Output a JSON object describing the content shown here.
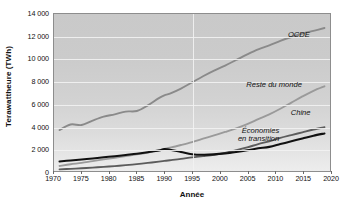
{
  "chart_data": {
    "type": "line",
    "title": "",
    "subtitle": "",
    "xlabel": "Année",
    "ylabel": "Terawattheure (TWh)",
    "xlim": [
      1970,
      2020
    ],
    "ylim": [
      0,
      14000
    ],
    "x_ticks": [
      1970,
      1975,
      1980,
      1985,
      1990,
      1995,
      2000,
      2005,
      2010,
      2015,
      2020
    ],
    "x_tick_labels": [
      "1970",
      "1975",
      "1980",
      "1985",
      "1990",
      "1995",
      "2000",
      "2005",
      "2010",
      "2015",
      "2020"
    ],
    "y_ticks": [
      0,
      2000,
      4000,
      6000,
      8000,
      10000,
      12000,
      14000
    ],
    "y_tick_labels": [
      "0",
      "2 000",
      "4 000",
      "6 000",
      "8 000",
      "10 000",
      "12 000",
      "14 000"
    ],
    "grid": "both-white-gridlines",
    "legend_position": "inline-end-of-line-annotations",
    "x": [
      1971,
      1973,
      1975,
      1977,
      1979,
      1981,
      1983,
      1985,
      1987,
      1989,
      1990,
      1991,
      1993,
      1995,
      1997,
      1999,
      2001,
      2003,
      2005,
      2007,
      2009,
      2011,
      2013,
      2015,
      2017,
      2019
    ],
    "series": [
      {
        "name": "OCDE",
        "label": "OCDE",
        "color": "#8a8a8a",
        "width": 1.9,
        "values": [
          3650,
          4150,
          4100,
          4500,
          4850,
          5050,
          5300,
          5350,
          5850,
          6500,
          6750,
          6900,
          7350,
          7900,
          8450,
          8950,
          9400,
          9900,
          10400,
          10850,
          11200,
          11600,
          11950,
          12250,
          12500,
          12750
        ]
      },
      {
        "name": "Reste du monde",
        "label": "Reste du monde",
        "color": "#9a9a9a",
        "width": 1.9,
        "values": [
          450,
          600,
          720,
          880,
          1030,
          1180,
          1330,
          1480,
          1650,
          1850,
          1980,
          2080,
          2320,
          2580,
          2880,
          3180,
          3480,
          3800,
          4180,
          4620,
          5050,
          5550,
          6100,
          6650,
          7150,
          7550
        ]
      },
      {
        "name": "Chine",
        "label": "Chine",
        "color": "#5c5c5c",
        "width": 1.9,
        "values": [
          150,
          190,
          240,
          300,
          370,
          440,
          520,
          610,
          720,
          840,
          900,
          960,
          1080,
          1220,
          1330,
          1450,
          1620,
          1850,
          2100,
          2400,
          2650,
          2950,
          3200,
          3450,
          3700,
          3900
        ]
      },
      {
        "name": "Économies en transition",
        "label": "Économies en transition",
        "label_lines": [
          "Économies",
          "en transition"
        ],
        "color": "#111111",
        "width": 2.1,
        "values": [
          850,
          940,
          1030,
          1120,
          1220,
          1320,
          1430,
          1540,
          1680,
          1830,
          1950,
          1900,
          1700,
          1500,
          1450,
          1480,
          1570,
          1700,
          1850,
          2020,
          2150,
          2400,
          2650,
          2900,
          3150,
          3350
        ]
      }
    ],
    "annotations": [
      {
        "text": "OCDE",
        "series": "OCDE",
        "x_px_frac": 0.845,
        "y_px_frac": 0.115
      },
      {
        "text": "Reste du monde",
        "series": "Reste du monde",
        "x_px_frac": 0.695,
        "y_px_frac": 0.425
      },
      {
        "text": "Chine",
        "series": "Chine",
        "x_px_frac": 0.855,
        "y_px_frac": 0.605
      },
      {
        "text": "Économies en transition",
        "series": "Économies en transition",
        "x_px_frac": 0.665,
        "y_px_frac": 0.715
      }
    ]
  },
  "figure": {
    "y_axis_title": "Terawattheure (TWh)",
    "x_axis_title": "Année",
    "plot_frame_color": "#8d8d8d",
    "background_color": "#ffffff"
  },
  "annotations": {
    "ocde": "OCDE",
    "reste": "Reste du monde",
    "chine": "Chine",
    "econ_line1": "Économies",
    "econ_line2": "en transition"
  }
}
